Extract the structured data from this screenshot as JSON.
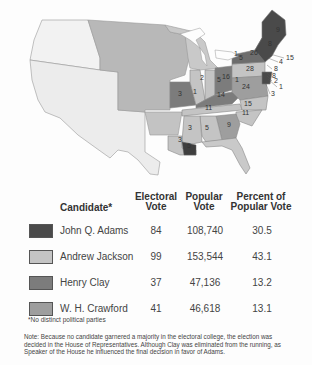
{
  "map": {
    "title": "Election of 1824",
    "state_labels": [
      {
        "value": "9",
        "x": 276,
        "y": 32
      },
      {
        "value": "8",
        "x": 268,
        "y": 46
      },
      {
        "value": "26",
        "x": 250,
        "y": 55
      },
      {
        "value": "1",
        "x": 234,
        "y": 56
      },
      {
        "value": "5",
        "x": 239,
        "y": 60
      },
      {
        "value": "15",
        "x": 286,
        "y": 60
      },
      {
        "value": "4",
        "x": 279,
        "y": 64
      },
      {
        "value": "28",
        "x": 246,
        "y": 71
      },
      {
        "value": "8",
        "x": 274,
        "y": 71
      },
      {
        "value": "8",
        "x": 272,
        "y": 78
      },
      {
        "value": "2",
        "x": 274,
        "y": 83
      },
      {
        "value": "1",
        "x": 279,
        "y": 89
      },
      {
        "value": "3",
        "x": 271,
        "y": 96
      },
      {
        "value": "2",
        "x": 200,
        "y": 80
      },
      {
        "value": "5",
        "x": 217,
        "y": 82
      },
      {
        "value": "16",
        "x": 222,
        "y": 79
      },
      {
        "value": "1",
        "x": 235,
        "y": 82
      },
      {
        "value": "24",
        "x": 242,
        "y": 89
      },
      {
        "value": "3",
        "x": 178,
        "y": 96
      },
      {
        "value": "1",
        "x": 193,
        "y": 94
      },
      {
        "value": "14",
        "x": 217,
        "y": 97
      },
      {
        "value": "15",
        "x": 244,
        "y": 106
      },
      {
        "value": "11",
        "x": 205,
        "y": 110
      },
      {
        "value": "11",
        "x": 242,
        "y": 115
      },
      {
        "value": "3",
        "x": 188,
        "y": 130
      },
      {
        "value": "5",
        "x": 205,
        "y": 130
      },
      {
        "value": "9",
        "x": 227,
        "y": 127
      },
      {
        "value": "3",
        "x": 178,
        "y": 142
      },
      {
        "value": "5",
        "x": 187,
        "y": 148
      }
    ]
  },
  "table": {
    "headers": {
      "candidate": "Candidate*",
      "electoral_1": "Electoral",
      "electoral_2": "Vote",
      "popular_1": "Popular",
      "popular_2": "Vote",
      "percent_1": "Percent of",
      "percent_2": "Popular Vote"
    },
    "rows": [
      {
        "candidate": "John Q. Adams",
        "electoral": "84",
        "popular": "108,740",
        "percent": "30.5",
        "color": "#4a4a4a"
      },
      {
        "candidate": "Andrew Jackson",
        "electoral": "99",
        "popular": "153,544",
        "percent": "43.1",
        "color": "#c4c4c4"
      },
      {
        "candidate": "Henry Clay",
        "electoral": "37",
        "popular": "47,136",
        "percent": "13.2",
        "color": "#7c7c7c"
      },
      {
        "candidate": "W. H. Crawford",
        "electoral": "41",
        "popular": "46,618",
        "percent": "13.1",
        "color": "#9e9e9e"
      }
    ]
  },
  "footnote": "*No distinct political parties",
  "note": "Note: Because no candidate garnered a majority in the electoral college, the election was decided in the House of Representatives. Although Clay was eliminated from the running, as Speaker of the House he influenced the final decision in favor of Adams."
}
